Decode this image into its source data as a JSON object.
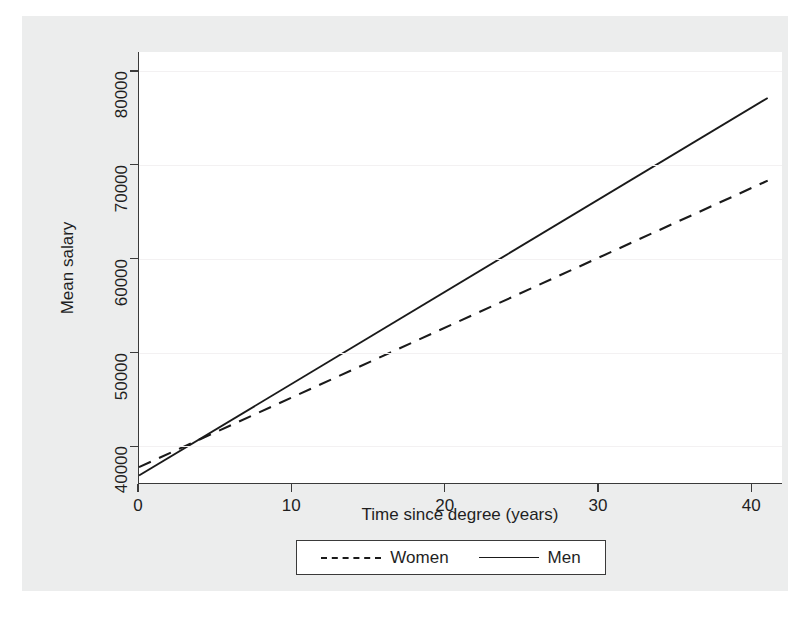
{
  "chart_data": {
    "type": "line",
    "title": "",
    "xlabel": "Time since degree (years)",
    "ylabel": "Mean salary",
    "xlim": [
      0,
      42
    ],
    "ylim": [
      36000,
      82000
    ],
    "xticks": [
      0,
      10,
      20,
      30,
      40
    ],
    "xtick_labels": [
      "0",
      "10",
      "20",
      "30",
      "40"
    ],
    "yticks": [
      40000,
      50000,
      60000,
      70000,
      80000
    ],
    "ytick_labels": [
      "40000",
      "50000",
      "60000",
      "70000",
      "80000"
    ],
    "grid": "horizontal",
    "legend_position": "bottom",
    "series": [
      {
        "name": "Women",
        "style": "dashed",
        "color": "#1a1a1a",
        "x": [
          0,
          41
        ],
        "values": [
          37800,
          68300
        ]
      },
      {
        "name": "Men",
        "style": "solid",
        "color": "#1a1a1a",
        "x": [
          0,
          41
        ],
        "values": [
          36900,
          77100
        ]
      }
    ]
  },
  "legend": {
    "items": [
      {
        "label": "Women",
        "style": "dashed"
      },
      {
        "label": "Men",
        "style": "solid"
      }
    ]
  },
  "colors": {
    "graph_region": "#eceded",
    "plot_region": "#ffffff",
    "axis": "#3a3a3a",
    "gridline": "#f3f1f2",
    "line": "#1a1a1a"
  }
}
